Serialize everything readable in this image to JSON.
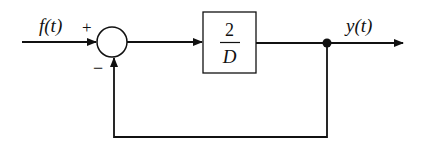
{
  "diagram": {
    "type": "block-diagram",
    "input": {
      "label": "f(t)"
    },
    "summing_junction": {
      "plus_sign": "+",
      "minus_sign": "−"
    },
    "block": {
      "numerator": "2",
      "denominator": "D"
    },
    "output": {
      "label": "y(t)"
    },
    "feedback": {
      "type": "unity negative feedback"
    }
  }
}
